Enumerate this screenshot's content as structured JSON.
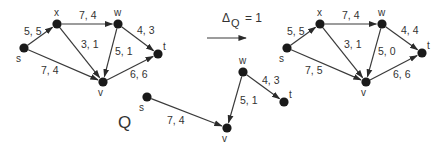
{
  "colors": {
    "ink": "#1a1a1a",
    "edge": "#3a3a3a",
    "text": "#333333",
    "background": "#ffffff"
  },
  "transform": {
    "label": "Δ",
    "subscript": "Q",
    "equals": "= 1"
  },
  "graphs": {
    "left": {
      "nodes": [
        {
          "id": "s",
          "x": 24,
          "y": 48,
          "lx": 16,
          "ly": 62
        },
        {
          "id": "x",
          "x": 57,
          "y": 24,
          "lx": 54,
          "ly": 16
        },
        {
          "id": "w",
          "x": 118,
          "y": 24,
          "lx": 114,
          "ly": 16
        },
        {
          "id": "v",
          "x": 103,
          "y": 82,
          "lx": 98,
          "ly": 96
        },
        {
          "id": "t",
          "x": 158,
          "y": 54,
          "lx": 163,
          "ly": 50
        }
      ],
      "edges": [
        {
          "from": "s",
          "to": "x",
          "label": "5, 5",
          "lx": 24,
          "ly": 35
        },
        {
          "from": "x",
          "to": "w",
          "label": "7, 4",
          "lx": 79,
          "ly": 19
        },
        {
          "from": "x",
          "to": "v",
          "label": "3, 1",
          "lx": 81,
          "ly": 48
        },
        {
          "from": "w",
          "to": "v",
          "label": "5, 1",
          "lx": 115,
          "ly": 55
        },
        {
          "from": "w",
          "to": "t",
          "label": "4, 3",
          "lx": 137,
          "ly": 34
        },
        {
          "from": "s",
          "to": "v",
          "label": "7, 4",
          "lx": 41,
          "ly": 74
        },
        {
          "from": "v",
          "to": "t",
          "label": "6, 6",
          "lx": 130,
          "ly": 78
        }
      ]
    },
    "right": {
      "nodes": [
        {
          "id": "s",
          "x": 287,
          "y": 48,
          "lx": 279,
          "ly": 62
        },
        {
          "id": "x",
          "x": 320,
          "y": 24,
          "lx": 317,
          "ly": 16
        },
        {
          "id": "w",
          "x": 382,
          "y": 24,
          "lx": 378,
          "ly": 16
        },
        {
          "id": "v",
          "x": 366,
          "y": 82,
          "lx": 361,
          "ly": 96
        },
        {
          "id": "t",
          "x": 422,
          "y": 53,
          "lx": 427,
          "ly": 49
        }
      ],
      "edges": [
        {
          "from": "s",
          "to": "x",
          "label": "5, 5",
          "lx": 287,
          "ly": 35
        },
        {
          "from": "x",
          "to": "w",
          "label": "7, 4",
          "lx": 342,
          "ly": 19
        },
        {
          "from": "x",
          "to": "v",
          "label": "3, 1",
          "lx": 344,
          "ly": 48
        },
        {
          "from": "w",
          "to": "v",
          "label": "5, 0",
          "lx": 378,
          "ly": 55
        },
        {
          "from": "w",
          "to": "t",
          "label": "4, 4",
          "lx": 401,
          "ly": 34
        },
        {
          "from": "s",
          "to": "v",
          "label": "7, 5",
          "lx": 305,
          "ly": 74
        },
        {
          "from": "v",
          "to": "t",
          "label": "6, 6",
          "lx": 393,
          "ly": 78
        }
      ]
    },
    "path": {
      "name": "Q",
      "name_x": 118,
      "name_y": 128,
      "nodes": [
        {
          "id": "s",
          "x": 147,
          "y": 97,
          "lx": 139,
          "ly": 111
        },
        {
          "id": "v",
          "x": 227,
          "y": 128,
          "lx": 222,
          "ly": 142
        },
        {
          "id": "w",
          "x": 243,
          "y": 72,
          "lx": 239,
          "ly": 64
        },
        {
          "id": "t",
          "x": 284,
          "y": 102,
          "lx": 289,
          "ly": 98
        }
      ],
      "edges": [
        {
          "from": "s",
          "to": "v",
          "label": "7, 4",
          "lx": 167,
          "ly": 124
        },
        {
          "from": "w",
          "to": "v",
          "label": "5, 1",
          "lx": 240,
          "ly": 104
        },
        {
          "from": "w",
          "to": "t",
          "label": "4, 3",
          "lx": 262,
          "ly": 84
        }
      ]
    }
  }
}
